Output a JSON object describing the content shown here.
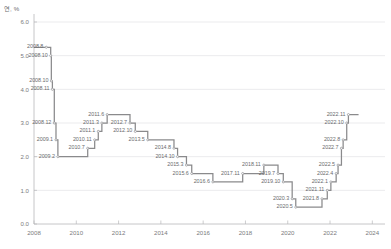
{
  "chart_data": {
    "type": "line",
    "title": "",
    "subtitle": "",
    "unit_label": "연, %",
    "xlabel": "",
    "ylabel": "",
    "step": "post",
    "grid": true,
    "legend_position": "none",
    "xlim": [
      2008.0,
      2024.6
    ],
    "ylim": [
      0.0,
      6.0
    ],
    "yticks": [
      "0.0",
      "1.0",
      "2.0",
      "3.0",
      "4.0",
      "5.0",
      "6.0"
    ],
    "ytick_values": [
      0.0,
      1.0,
      2.0,
      3.0,
      4.0,
      5.0,
      6.0
    ],
    "xticks": [
      "2008",
      "2010",
      "2012",
      "2014",
      "2016",
      "2018",
      "2020",
      "2022",
      "2024"
    ],
    "xtick_values": [
      2008,
      2010,
      2012,
      2014,
      2016,
      2018,
      2020,
      2022,
      2024
    ],
    "line_color": "#8a8a8c",
    "grid_color": "#e3e3e5",
    "axis_color": "#b8b8ba",
    "marker_color": "#9a9a9c",
    "series": [
      {
        "name": "한국은행 기준금리",
        "points": [
          {
            "label": "2008.8",
            "x": 2008.58,
            "y": 5.25,
            "side": "right"
          },
          {
            "label": "2008.10",
            "x": 2008.79,
            "y": 5.0,
            "side": "right"
          },
          {
            "label": "2008.10",
            "x": 2008.82,
            "y": 4.25,
            "side": "right"
          },
          {
            "label": "2008.11",
            "x": 2008.87,
            "y": 4.0,
            "side": "right"
          },
          {
            "label": "2008.12",
            "x": 2008.96,
            "y": 3.0,
            "side": "right"
          },
          {
            "label": "2009.1",
            "x": 2009.04,
            "y": 2.5,
            "side": "right"
          },
          {
            "label": "2009.2",
            "x": 2009.13,
            "y": 2.0,
            "side": "right"
          },
          {
            "label": "2010.7",
            "x": 2010.54,
            "y": 2.25,
            "side": "right"
          },
          {
            "label": "2010.11",
            "x": 2010.87,
            "y": 2.5,
            "side": "right"
          },
          {
            "label": "2011.1",
            "x": 2011.04,
            "y": 2.75,
            "side": "right"
          },
          {
            "label": "2011.3",
            "x": 2011.21,
            "y": 3.0,
            "side": "right"
          },
          {
            "label": "2011.6",
            "x": 2011.46,
            "y": 3.25,
            "side": "right"
          },
          {
            "label": "2012.7",
            "x": 2012.54,
            "y": 3.0,
            "side": "left"
          },
          {
            "label": "2012.10",
            "x": 2012.79,
            "y": 2.75,
            "side": "left"
          },
          {
            "label": "2013.5",
            "x": 2013.38,
            "y": 2.5,
            "side": "left"
          },
          {
            "label": "2014.8",
            "x": 2014.62,
            "y": 2.25,
            "side": "left"
          },
          {
            "label": "2014.10",
            "x": 2014.79,
            "y": 2.0,
            "side": "left"
          },
          {
            "label": "2015.3",
            "x": 2015.21,
            "y": 1.75,
            "side": "left"
          },
          {
            "label": "2015.6",
            "x": 2015.46,
            "y": 1.5,
            "side": "left"
          },
          {
            "label": "2016.6",
            "x": 2016.46,
            "y": 1.25,
            "side": "left"
          },
          {
            "label": "2017.11",
            "x": 2017.87,
            "y": 1.5,
            "side": "left"
          },
          {
            "label": "2018.11",
            "x": 2018.87,
            "y": 1.75,
            "side": "left"
          },
          {
            "label": "2019.7",
            "x": 2019.54,
            "y": 1.5,
            "side": "left"
          },
          {
            "label": "2019.10",
            "x": 2019.79,
            "y": 1.25,
            "side": "left"
          },
          {
            "label": "2020.3",
            "x": 2020.21,
            "y": 0.75,
            "side": "left"
          },
          {
            "label": "2020.5",
            "x": 2020.38,
            "y": 0.5,
            "side": "left"
          },
          {
            "label": "2021.8",
            "x": 2021.62,
            "y": 0.75,
            "side": "left"
          },
          {
            "label": "2021.11",
            "x": 2021.87,
            "y": 1.0,
            "side": "left"
          },
          {
            "label": "2022.1",
            "x": 2022.04,
            "y": 1.25,
            "side": "left"
          },
          {
            "label": "2022.4",
            "x": 2022.29,
            "y": 1.5,
            "side": "left"
          },
          {
            "label": "2022.5",
            "x": 2022.38,
            "y": 1.75,
            "side": "left"
          },
          {
            "label": "2022.7",
            "x": 2022.54,
            "y": 2.25,
            "side": "left"
          },
          {
            "label": "2022.8",
            "x": 2022.62,
            "y": 2.5,
            "side": "left"
          },
          {
            "label": "2022.10",
            "x": 2022.79,
            "y": 3.0,
            "side": "left"
          },
          {
            "label": "2022.11",
            "x": 2022.87,
            "y": 3.25,
            "side": "left"
          }
        ],
        "end_x": 2023.35
      }
    ]
  }
}
